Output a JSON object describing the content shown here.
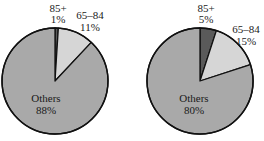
{
  "chart_data": [
    {
      "type": "pie",
      "title": "",
      "categories": [
        "85+",
        "65–84",
        "Others"
      ],
      "values": [
        1,
        11,
        88
      ],
      "value_labels": [
        "1%",
        "11%",
        "88%"
      ],
      "colors": [
        "#5a5a5a",
        "#d6d6d6",
        "#a9a9a9"
      ],
      "start_angle_deg": 0,
      "direction": "clockwise",
      "center": [
        55,
        81
      ],
      "radius": 53,
      "label_positions": [
        {
          "x": 58,
          "y1": 12,
          "y2": 23
        },
        {
          "x": 90,
          "y1": 19,
          "y2": 31
        },
        {
          "x": 46,
          "y1": 102,
          "y2": 114
        }
      ]
    },
    {
      "type": "pie",
      "title": "",
      "categories": [
        "85+",
        "65–84",
        "Others"
      ],
      "values": [
        5,
        15,
        80
      ],
      "value_labels": [
        "5%",
        "15%",
        "80%"
      ],
      "colors": [
        "#5a5a5a",
        "#d6d6d6",
        "#a9a9a9"
      ],
      "start_angle_deg": 0,
      "direction": "clockwise",
      "center": [
        200,
        81
      ],
      "radius": 53,
      "label_positions": [
        {
          "x": 206,
          "y1": 12,
          "y2": 23
        },
        {
          "x": 246,
          "y1": 33,
          "y2": 45
        },
        {
          "x": 194,
          "y1": 102,
          "y2": 114
        }
      ]
    }
  ],
  "style": {
    "outline_color": "#111111",
    "background": "#ffffff"
  }
}
